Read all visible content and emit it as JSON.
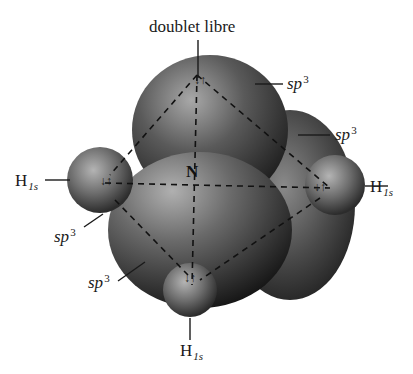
{
  "figure": {
    "title": "doublet libre",
    "central_atom": "N",
    "lobe_label": {
      "base": "sp",
      "sup": "3"
    },
    "hydrogen_label": {
      "base": "H",
      "sub": "1s"
    },
    "spin_pair_glyph": "↓↑",
    "labels": {
      "lone_pair": "doublet libre",
      "sp3_top_right_1": "sp",
      "sp3_top_right_1_sup": "3",
      "sp3_top_right_2": "sp",
      "sp3_top_right_2_sup": "3",
      "sp3_left": "sp",
      "sp3_left_sup": "3",
      "sp3_bottom_left": "sp",
      "sp3_bottom_left_sup": "3",
      "h_left": "H",
      "h_left_sub": "1s",
      "h_right": "H",
      "h_right_sub": "1s",
      "h_bottom": "H",
      "h_bottom_sub": "1s",
      "nitrogen": "N"
    },
    "colors": {
      "background": "#ffffff",
      "lobe_light": "#9a9a9a",
      "lobe_dark": "#1e1e1e",
      "text": "#1a1a1a",
      "dash": "#111111"
    }
  }
}
